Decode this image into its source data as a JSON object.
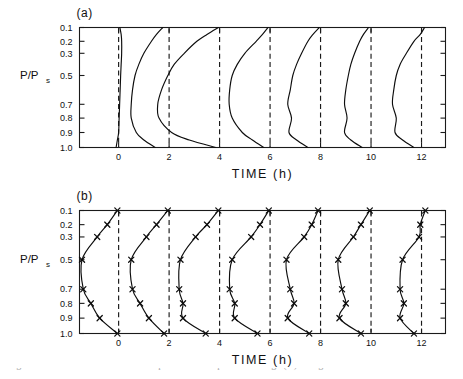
{
  "figure": {
    "width": 463,
    "height": 379,
    "background": "#ffffff",
    "ink_color": "#0d0d0d"
  },
  "panels": [
    {
      "id": "a",
      "label": "(a)"
    },
    {
      "id": "b",
      "label": "(b)"
    }
  ],
  "axes": {
    "x_title": "TIME  (h)",
    "x_ticks": [
      "0",
      "2",
      "4",
      "6",
      "8",
      "10",
      "12"
    ],
    "x_tick_values": [
      0,
      2,
      4,
      6,
      8,
      10,
      12
    ],
    "x_min": -1.55,
    "x_max": 12.95,
    "y_title_main": "P/P",
    "y_title_sub": "s",
    "y_ticks": [
      "0.1",
      "0.2",
      "0.3",
      "0.5",
      "0.7",
      "0.8",
      "0.9",
      "1.0"
    ],
    "y_tick_values": [
      0.1,
      0.2,
      0.3,
      0.5,
      0.7,
      0.8,
      0.9,
      1.0
    ],
    "y_tick_fracs": [
      0.0,
      0.115,
      0.215,
      0.4,
      0.64,
      0.755,
      0.875,
      1.0
    ],
    "reference_lines": [
      0,
      2,
      4,
      6,
      8,
      10,
      12
    ],
    "reference_line_style": "dashed"
  },
  "caption": {
    "text": "Figure 10. Time evolution of vertical profiles of temperature change (K) in Figure 10.",
    "clipped": true
  },
  "chart_data": {
    "type": "line",
    "title": "",
    "xlabel": "TIME  (h)",
    "ylabel": "P/Ps",
    "xlim": [
      -1.55,
      12.95
    ],
    "ylim": [
      1.0,
      0.1
    ],
    "y_inverted": true,
    "grid": false,
    "legend": null,
    "panels": [
      {
        "id": "a",
        "label": "(a)",
        "markers": false,
        "series": [
          {
            "name": "t=0h",
            "base": 0,
            "y": [
              0.1,
              0.15,
              0.2,
              0.3,
              0.4,
              0.5,
              0.6,
              0.7,
              0.8,
              0.9,
              0.95,
              1.0
            ],
            "offset": [
              0.05,
              0.1,
              0.12,
              0.12,
              0.1,
              0.08,
              0.06,
              0.04,
              0.02,
              0.0,
              -0.05,
              -0.1
            ]
          },
          {
            "name": "t=2h",
            "base": 2,
            "y": [
              0.1,
              0.15,
              0.2,
              0.3,
              0.4,
              0.5,
              0.6,
              0.7,
              0.8,
              0.9,
              0.95,
              1.0
            ],
            "offset": [
              -0.25,
              -0.5,
              -0.7,
              -1.0,
              -1.2,
              -1.35,
              -1.45,
              -1.5,
              -1.5,
              -1.3,
              -1.0,
              -0.55
            ]
          },
          {
            "name": "t=4h",
            "base": 4,
            "y": [
              0.1,
              0.15,
              0.2,
              0.3,
              0.4,
              0.5,
              0.6,
              0.7,
              0.8,
              0.9,
              0.95,
              1.0
            ],
            "offset": [
              -0.05,
              -0.5,
              -0.9,
              -1.4,
              -1.8,
              -2.05,
              -2.3,
              -2.45,
              -2.4,
              -1.9,
              -1.2,
              -0.15
            ]
          },
          {
            "name": "t=6h",
            "base": 6,
            "y": [
              0.1,
              0.15,
              0.2,
              0.3,
              0.4,
              0.5,
              0.6,
              0.7,
              0.8,
              0.9,
              0.95,
              1.0
            ],
            "offset": [
              -0.08,
              -0.3,
              -0.55,
              -1.0,
              -1.3,
              -1.5,
              -1.6,
              -1.62,
              -1.5,
              -1.1,
              -0.7,
              -0.25
            ]
          },
          {
            "name": "t=8h",
            "base": 8,
            "y": [
              0.1,
              0.15,
              0.2,
              0.3,
              0.4,
              0.5,
              0.6,
              0.7,
              0.8,
              0.9,
              0.95,
              1.0
            ],
            "offset": [
              -0.05,
              -0.3,
              -0.5,
              -0.75,
              -0.95,
              -1.1,
              -1.2,
              -1.3,
              -1.15,
              -1.25,
              -0.95,
              -0.5
            ]
          },
          {
            "name": "t=10h",
            "base": 10,
            "y": [
              0.1,
              0.15,
              0.2,
              0.3,
              0.4,
              0.5,
              0.6,
              0.7,
              0.8,
              0.9,
              0.95,
              1.0
            ],
            "offset": [
              -0.1,
              -0.3,
              -0.45,
              -0.65,
              -0.8,
              -0.9,
              -1.0,
              -1.05,
              -0.95,
              -1.05,
              -0.8,
              -0.35
            ]
          },
          {
            "name": "t=12h",
            "base": 12,
            "y": [
              0.1,
              0.15,
              0.2,
              0.3,
              0.4,
              0.5,
              0.6,
              0.7,
              0.8,
              0.9,
              0.95,
              1.0
            ],
            "offset": [
              0.12,
              -0.05,
              -0.3,
              -0.6,
              -0.85,
              -1.0,
              -1.1,
              -1.15,
              -1.0,
              -1.05,
              -0.75,
              -0.3
            ]
          }
        ]
      },
      {
        "id": "b",
        "label": "(b)",
        "markers": true,
        "marker_shape": "x",
        "series": [
          {
            "name": "t=0h",
            "base": 0,
            "y": [
              0.1,
              0.2,
              0.3,
              0.5,
              0.7,
              0.8,
              0.9,
              1.0
            ],
            "offset": [
              -0.05,
              -0.45,
              -0.85,
              -1.45,
              -1.4,
              -1.1,
              -0.75,
              -0.05
            ]
          },
          {
            "name": "t=2h",
            "base": 2,
            "y": [
              0.1,
              0.2,
              0.3,
              0.5,
              0.7,
              0.8,
              0.9,
              1.0
            ],
            "offset": [
              -0.05,
              -0.5,
              -0.9,
              -1.5,
              -1.45,
              -1.15,
              -0.8,
              -0.2
            ]
          },
          {
            "name": "t=4h",
            "base": 4,
            "y": [
              0.1,
              0.2,
              0.3,
              0.5,
              0.7,
              0.8,
              0.9,
              1.0
            ],
            "offset": [
              -0.05,
              -0.5,
              -0.95,
              -1.55,
              -1.6,
              -1.45,
              -1.45,
              -0.55
            ]
          },
          {
            "name": "t=6h",
            "base": 6,
            "y": [
              0.1,
              0.2,
              0.3,
              0.5,
              0.7,
              0.8,
              0.9,
              1.0
            ],
            "offset": [
              -0.05,
              -0.4,
              -0.75,
              -1.5,
              -1.6,
              -1.4,
              -1.4,
              -0.5
            ]
          },
          {
            "name": "t=8h",
            "base": 8,
            "y": [
              0.1,
              0.2,
              0.3,
              0.5,
              0.7,
              0.8,
              0.9,
              1.0
            ],
            "offset": [
              -0.1,
              -0.35,
              -0.65,
              -1.35,
              -1.2,
              -1.05,
              -1.3,
              -0.45
            ]
          },
          {
            "name": "t=10h",
            "base": 10,
            "y": [
              0.1,
              0.2,
              0.3,
              0.5,
              0.7,
              0.8,
              0.9,
              1.0
            ],
            "offset": [
              -0.05,
              -0.4,
              -0.7,
              -1.3,
              -1.15,
              -1.0,
              -1.25,
              -0.4
            ]
          },
          {
            "name": "t=12h",
            "base": 12,
            "y": [
              0.1,
              0.2,
              0.3,
              0.5,
              0.7,
              0.8,
              0.9,
              1.0
            ],
            "offset": [
              0.15,
              -0.05,
              -0.1,
              -0.75,
              -0.85,
              -0.7,
              -0.85,
              -0.3
            ]
          }
        ]
      }
    ]
  }
}
